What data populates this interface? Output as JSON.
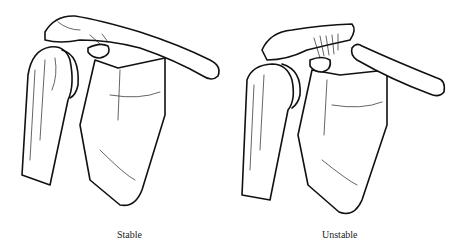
{
  "figure": {
    "panels": [
      {
        "label": "Stable",
        "depiction": "intact shoulder: clavicle, acromioclavicular joint, scapula, humeral head"
      },
      {
        "label": "Unstable",
        "depiction": "disrupted shoulder: separated clavicle with torn ligaments"
      }
    ]
  }
}
